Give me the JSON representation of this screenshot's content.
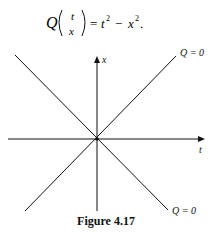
{
  "equation": {
    "function": "Q",
    "vector_top": "t",
    "vector_bottom": "x",
    "rhs_a": "t",
    "rhs_op": "−",
    "rhs_b": "x",
    "exp": "2",
    "terminator": "."
  },
  "diagram": {
    "vertical_axis_label": "x",
    "horizontal_axis_label": "t",
    "top_right_label": "Q = 0",
    "bottom_right_label": "Q = 0",
    "line_color": "#111111"
  },
  "caption": "Figure 4.17"
}
